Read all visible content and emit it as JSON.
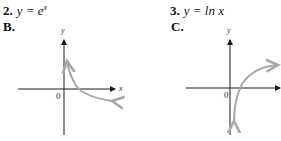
{
  "problems": [
    {
      "number": "2.",
      "equation_prefix": "y = e",
      "equation_exponent": "x",
      "answer_letter": "B.",
      "graph": {
        "y_axis_label": "y",
        "x_axis_label": "x",
        "origin_label": "0"
      }
    },
    {
      "number": "3.",
      "equation_prefix": "y = ln ",
      "equation_var": "x",
      "answer_letter": "C.",
      "graph": {
        "y_axis_label": "y",
        "origin_label": "0"
      }
    }
  ],
  "colors": {
    "axis": "#1a1a1a",
    "curve": "#a8a8a8",
    "text": "#111111"
  }
}
